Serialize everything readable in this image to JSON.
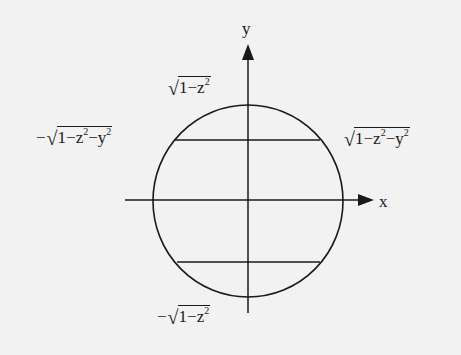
{
  "diagram": {
    "axes": {
      "x_label": "x",
      "y_label": "y"
    },
    "labels": {
      "top_y_limit": {
        "sign": "",
        "radicand": [
          "1",
          "−",
          "z",
          "2"
        ]
      },
      "bottom_y_limit": {
        "sign": "−",
        "radicand": [
          "1",
          "−",
          "z",
          "2"
        ]
      },
      "left_x_limit": {
        "sign": "−",
        "radicand": [
          "1",
          "−",
          "z",
          "2",
          "−",
          "y",
          "2"
        ]
      },
      "right_x_limit": {
        "sign": "",
        "radicand": [
          "1",
          "−",
          "z",
          "2",
          "−",
          "y",
          "2"
        ]
      }
    },
    "text": {
      "top_limit": "√(1−z²)",
      "bottom_limit": "−√(1−z²)",
      "left_limit": "−√(1−z²−y²)",
      "right_limit": "√(1−z²−y²)"
    },
    "colors": {
      "background": "#f2f2f2",
      "stroke": "#1a1a1a"
    }
  }
}
